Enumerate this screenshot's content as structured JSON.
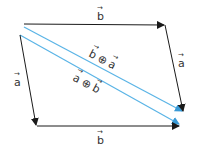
{
  "diagram": {
    "colors": {
      "vector": "#1a1a1a",
      "sum": "#5ab4e6",
      "text": "#333333",
      "background": "#ffffff"
    },
    "vectors": [
      {
        "id": "b_top",
        "label": "b",
        "from": [
          24,
          24
        ],
        "to": [
          165,
          25
        ],
        "color": "vector"
      },
      {
        "id": "a_right",
        "label": "a",
        "from": [
          165,
          25
        ],
        "to": [
          183,
          112
        ],
        "color": "vector"
      },
      {
        "id": "a_left",
        "label": "a",
        "from": [
          20,
          35
        ],
        "to": [
          36,
          126
        ],
        "color": "vector"
      },
      {
        "id": "b_bottom",
        "label": "b",
        "from": [
          36,
          126
        ],
        "to": [
          180,
          127
        ],
        "color": "vector"
      },
      {
        "id": "b_plus_a",
        "label": "b ⊕ a",
        "from": [
          24,
          27
        ],
        "to": [
          183,
          112
        ],
        "color": "sum"
      },
      {
        "id": "a_plus_b",
        "label": "a ⊕ b",
        "from": [
          20,
          35
        ],
        "to": [
          180,
          125
        ],
        "color": "sum"
      }
    ],
    "labels": {
      "b_top": {
        "letter": "b",
        "arrow": "→"
      },
      "a_right": {
        "letter": "a",
        "arrow": "→"
      },
      "a_left": {
        "letter": "a",
        "arrow": "→"
      },
      "b_bottom": {
        "letter": "b",
        "arrow": "→"
      },
      "sum_upper": {
        "left": "b",
        "op": "⊕",
        "right": "a",
        "arrow": "→"
      },
      "sum_lower": {
        "left": "a",
        "op": "⊕",
        "right": "b",
        "arrow": "→"
      }
    }
  }
}
